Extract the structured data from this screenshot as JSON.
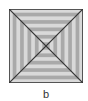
{
  "figure": {
    "caption": "b",
    "rings": 10,
    "colors": {
      "light": "#d9d9d9",
      "medium": "#a9a9a9",
      "border": "#555555",
      "diagonal": "#333333",
      "background": "#ffffff"
    }
  }
}
